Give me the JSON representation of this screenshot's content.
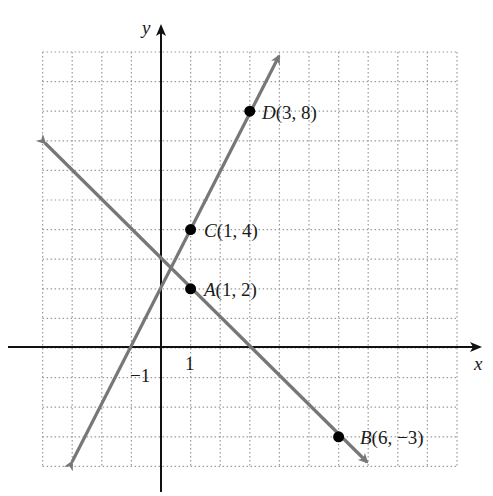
{
  "chart_data": {
    "type": "line",
    "title": "",
    "xlabel": "x",
    "ylabel": "y",
    "xlim": [
      -4,
      10
    ],
    "ylim": [
      -4,
      10
    ],
    "grid": true,
    "tick_labels": {
      "x": [
        "1"
      ],
      "y": [
        "-1"
      ]
    },
    "series": [
      {
        "name": "Line through C and D",
        "equation": "y = 2x + 2",
        "color": "#777777",
        "x": [
          -3,
          4
        ],
        "y": [
          -4,
          10
        ],
        "arrows": "both"
      },
      {
        "name": "Line through A and B",
        "equation": "y = -x + 3",
        "color": "#777777",
        "x": [
          -4,
          7
        ],
        "y": [
          7,
          -4
        ],
        "arrows": "both"
      }
    ],
    "points": [
      {
        "name": "A",
        "x": 1,
        "y": 2,
        "label": "A(1, 2)"
      },
      {
        "name": "B",
        "x": 6,
        "y": -3,
        "label": "B(6, −3)"
      },
      {
        "name": "C",
        "x": 1,
        "y": 4,
        "label": "C(1, 4)"
      },
      {
        "name": "D",
        "x": 3,
        "y": 8,
        "label": "D(3, 8)"
      }
    ]
  },
  "labels": {
    "x_axis": "x",
    "y_axis": "y",
    "tick_x_1": "1",
    "tick_y_neg1": "−1",
    "A": {
      "letter": "A",
      "coords": "(1, 2)"
    },
    "B": {
      "letter": "B",
      "coords": "(6, −3)"
    },
    "C": {
      "letter": "C",
      "coords": "(1, 4)"
    },
    "D": {
      "letter": "D",
      "coords": "(3, 8)"
    }
  },
  "colors": {
    "axis": "#111111",
    "grid": "#9a9a9a",
    "line": "#777777",
    "point": "#000000"
  }
}
